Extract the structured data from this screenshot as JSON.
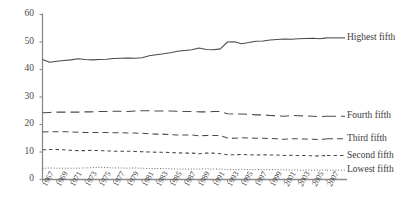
{
  "chart_data": {
    "type": "line",
    "title": "",
    "subtitle": "",
    "xlabel": "",
    "ylabel": "",
    "xlim": [
      1967,
      2007
    ],
    "ylim": [
      0,
      60
    ],
    "ytick_step": 10,
    "xtick_step": 2,
    "grid": false,
    "legend_position": "right-inline",
    "x": [
      1967,
      1968,
      1969,
      1970,
      1971,
      1972,
      1973,
      1974,
      1975,
      1976,
      1977,
      1978,
      1979,
      1980,
      1981,
      1982,
      1983,
      1984,
      1985,
      1986,
      1987,
      1988,
      1989,
      1990,
      1991,
      1992,
      1993,
      1994,
      1995,
      1996,
      1997,
      1998,
      1999,
      2000,
      2001,
      2002,
      2003,
      2004,
      2005,
      2006,
      2007
    ],
    "xtick_labels": [
      "1967",
      "1969",
      "1971",
      "1973",
      "1975",
      "1977",
      "1979",
      "1981",
      "1983",
      "1985",
      "1987",
      "1989",
      "1991",
      "1993",
      "1995",
      "1997",
      "1999",
      "2001",
      "2003",
      "2005",
      "2007"
    ],
    "ytick_labels": [
      "0",
      "10",
      "20",
      "30",
      "40",
      "50",
      "60"
    ],
    "series": [
      {
        "name": "Highest fifth",
        "label": "Highest fifth",
        "style": "solid",
        "color": "#4a4a4a",
        "values": [
          43.6,
          42.6,
          43.0,
          43.3,
          43.5,
          43.9,
          43.6,
          43.5,
          43.6,
          43.7,
          44.0,
          44.1,
          44.2,
          44.1,
          44.3,
          45.0,
          45.4,
          45.7,
          46.1,
          46.6,
          46.9,
          47.2,
          47.8,
          47.3,
          47.2,
          47.5,
          50.0,
          50.1,
          49.4,
          49.8,
          50.3,
          50.4,
          50.7,
          50.9,
          51.1,
          51.0,
          51.2,
          51.3,
          51.4,
          51.2,
          51.5
        ]
      },
      {
        "name": "Fourth fifth",
        "label": "Fourth fifth",
        "style": "longdash",
        "color": "#4a4a4a",
        "values": [
          24.3,
          24.4,
          24.5,
          24.5,
          24.5,
          24.5,
          24.6,
          24.6,
          24.7,
          24.7,
          24.8,
          24.8,
          24.7,
          24.9,
          25.0,
          25.0,
          24.9,
          24.9,
          24.9,
          24.8,
          24.7,
          24.7,
          24.6,
          24.6,
          24.7,
          24.7,
          23.9,
          23.8,
          23.8,
          23.7,
          23.5,
          23.5,
          23.3,
          23.2,
          23.0,
          23.3,
          23.2,
          23.1,
          23.0,
          22.9,
          23.0
        ]
      },
      {
        "name": "Third fifth",
        "label": "Third fifth",
        "style": "dash",
        "color": "#4a4a4a",
        "values": [
          17.3,
          17.4,
          17.4,
          17.4,
          17.3,
          17.2,
          17.1,
          17.1,
          17.1,
          17.1,
          17.0,
          17.0,
          16.9,
          16.9,
          16.8,
          16.6,
          16.5,
          16.5,
          16.3,
          16.2,
          16.2,
          16.2,
          15.9,
          16.0,
          16.0,
          16.0,
          15.1,
          15.0,
          15.2,
          15.1,
          15.0,
          15.0,
          14.9,
          14.8,
          14.6,
          14.8,
          14.8,
          14.7,
          14.6,
          14.5,
          14.8
        ]
      },
      {
        "name": "Second fifth",
        "label": "Second fifth",
        "style": "shortdash",
        "color": "#4a4a4a",
        "values": [
          10.8,
          10.9,
          10.9,
          10.8,
          10.6,
          10.5,
          10.5,
          10.6,
          10.5,
          10.4,
          10.3,
          10.3,
          10.3,
          10.2,
          10.1,
          10.0,
          9.9,
          9.9,
          9.8,
          9.7,
          9.6,
          9.6,
          9.4,
          9.6,
          9.6,
          9.4,
          9.0,
          9.0,
          9.1,
          9.0,
          8.9,
          9.0,
          8.9,
          8.9,
          8.7,
          8.8,
          8.7,
          8.7,
          8.6,
          8.6,
          8.7
        ]
      },
      {
        "name": "Lowest fifth",
        "label": "Lowest fifth",
        "style": "dotted",
        "color": "#6a6a6a",
        "values": [
          4.0,
          4.2,
          4.1,
          4.1,
          4.1,
          4.1,
          4.2,
          4.3,
          4.4,
          4.4,
          4.2,
          4.2,
          4.1,
          4.2,
          4.1,
          4.0,
          4.0,
          4.0,
          3.9,
          3.8,
          3.8,
          3.8,
          3.8,
          3.9,
          3.8,
          3.8,
          3.6,
          3.6,
          3.7,
          3.6,
          3.6,
          3.6,
          3.6,
          3.6,
          3.5,
          3.5,
          3.4,
          3.4,
          3.4,
          3.4,
          3.4
        ]
      }
    ]
  },
  "legend": {
    "items": [
      {
        "label": "Highest fifth"
      },
      {
        "label": "Fourth fifth"
      },
      {
        "label": "Third fifth"
      },
      {
        "label": "Second fifth"
      },
      {
        "label": "Lowest fifth"
      }
    ]
  }
}
